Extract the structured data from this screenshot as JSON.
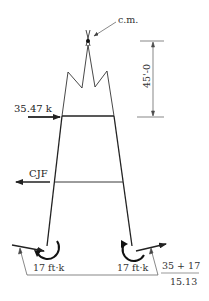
{
  "diagram": {
    "type": "free-body diagram",
    "labels": {
      "center_of_mass": "c.m.",
      "height_dimension": "45'-0",
      "applied_force": "35.47 k",
      "joint_force": "CJF",
      "left_moment": "17 ft·k",
      "right_moment": "17 ft·k",
      "fraction_numerator": "35 + 17",
      "fraction_denominator": "15.13"
    },
    "colors": {
      "line": "#222222",
      "thin_line": "#555555",
      "background": "#ffffff"
    }
  }
}
